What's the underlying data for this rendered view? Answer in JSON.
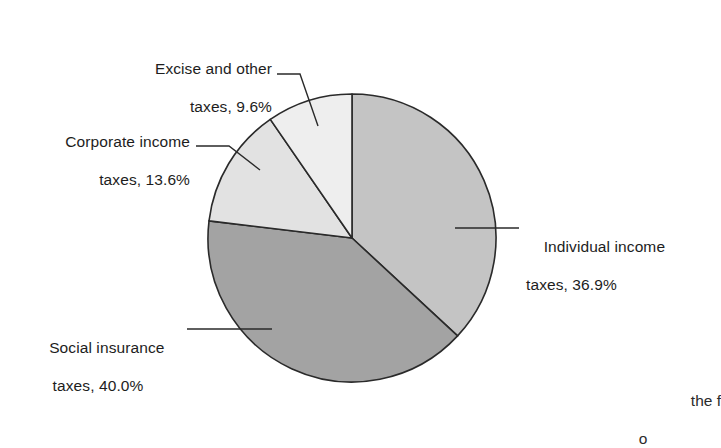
{
  "figure": {
    "background": "#ffffff",
    "partial_caption_line1": "the f",
    "partial_caption_line2": "o"
  },
  "chart_data": {
    "type": "pie",
    "title": "",
    "xlabel": "",
    "ylabel": "",
    "legend_position": "callout-labels",
    "grid": false,
    "units": "percent",
    "start_angle_deg": 0,
    "direction": "clockwise",
    "center": {
      "x": 352,
      "y": 238
    },
    "radius": 144,
    "categories": [
      "Individual income taxes",
      "Social insurance taxes",
      "Corporate income taxes",
      "Excise and other taxes"
    ],
    "values": [
      36.9,
      40.0,
      13.6,
      9.6
    ],
    "slices": [
      {
        "name": "Individual income taxes",
        "value": 36.9,
        "label_line1": "Individual income",
        "label_line2": "taxes, 36.9%",
        "color": "#c4c4c4",
        "start_deg": 0.0,
        "end_deg": 132.84
      },
      {
        "name": "Social insurance taxes",
        "value": 40.0,
        "label_line1": "Social insurance",
        "label_line2": "taxes, 40.0%",
        "color": "#a3a3a3",
        "start_deg": 132.84,
        "end_deg": 276.84
      },
      {
        "name": "Corporate income taxes",
        "value": 13.6,
        "label_line1": "Corporate income",
        "label_line2": "taxes, 13.6%",
        "color": "#e2e2e2",
        "start_deg": 276.84,
        "end_deg": 325.44
      },
      {
        "name": "Excise and other taxes",
        "value": 9.6,
        "label_line1": "Excise and other",
        "label_line2": "taxes, 9.6%",
        "color": "#eeeeee",
        "start_deg": 325.44,
        "end_deg": 360.0
      }
    ],
    "outline_color": "#2a2a2a",
    "outline_width": 1.6
  }
}
